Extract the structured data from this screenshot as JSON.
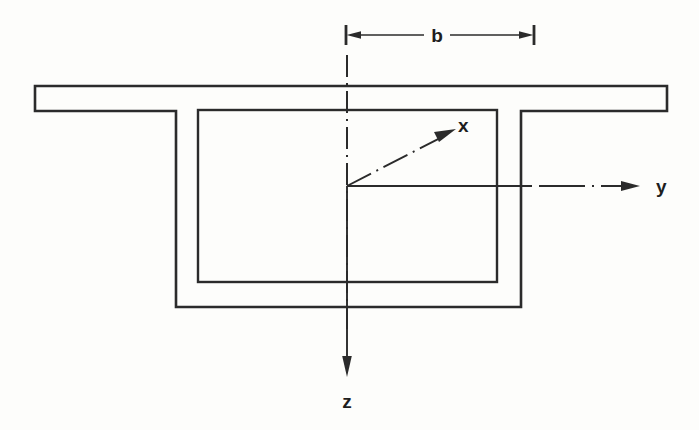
{
  "figure": {
    "background_color": "#fdfdfb",
    "line_color": "#2b2b2b",
    "labels": {
      "dimension_b": "b",
      "axis_x": "x",
      "axis_y": "y",
      "axis_z": "z"
    },
    "dimension": {
      "name": "b",
      "from": "section centerline",
      "to": "box web centerline",
      "line_style": "arrow-both-ends-with-ticks"
    },
    "axes": [
      {
        "name": "x",
        "direction": "up-right-diagonal",
        "style": "dash-dot",
        "arrow": "end"
      },
      {
        "name": "y",
        "direction": "right-horizontal",
        "style": "solid-then-dash-dot",
        "arrow": "end"
      },
      {
        "name": "z",
        "direction": "down-vertical",
        "style": "dash-dot",
        "arrow": "end"
      }
    ],
    "centerline": {
      "orientation": "vertical",
      "style": "dash-dot"
    },
    "geometry": {
      "top_flange": {
        "left": 35,
        "right": 667,
        "top": 86,
        "bottom": 111
      },
      "outer_box": {
        "left": 176,
        "right": 521,
        "top": 111,
        "bottom": 307
      },
      "inner_box": {
        "left": 198,
        "right": 497,
        "top": 110,
        "bottom": 282
      },
      "origin": {
        "x": 347,
        "y": 186
      }
    }
  }
}
